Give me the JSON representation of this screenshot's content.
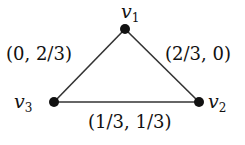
{
  "graph": {
    "nodes": [
      {
        "id": "v1",
        "name": "v",
        "sub": "1",
        "x": 125,
        "y": 29
      },
      {
        "id": "v2",
        "name": "v",
        "sub": "2",
        "x": 199,
        "y": 102
      },
      {
        "id": "v3",
        "name": "v",
        "sub": "3",
        "x": 54,
        "y": 102
      }
    ],
    "edges": [
      {
        "from": "v3",
        "to": "v1",
        "label": "(0, 2/3)"
      },
      {
        "from": "v1",
        "to": "v2",
        "label": "(2/3, 0)"
      },
      {
        "from": "v3",
        "to": "v2",
        "label": "(1/3, 1/3)"
      }
    ]
  },
  "colors": {
    "node": "#111111",
    "edge": "#333333"
  }
}
